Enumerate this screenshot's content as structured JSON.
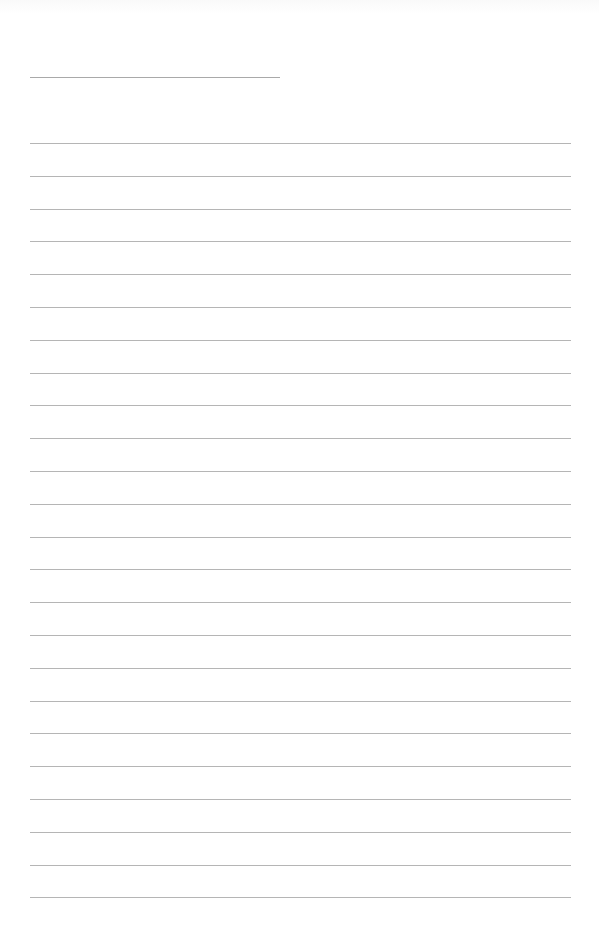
{
  "page": {
    "type": "lined-paper",
    "background": "#ffffff",
    "line_color": "#b5b5b5"
  },
  "heading_field": {
    "value": "",
    "line": {
      "x": 30,
      "y": 77,
      "width": 250
    }
  },
  "ruled_lines": {
    "count": 24,
    "start_y": 143,
    "spacing": 32.8,
    "x": 30,
    "width": 541,
    "entries": [
      "",
      "",
      "",
      "",
      "",
      "",
      "",
      "",
      "",
      "",
      "",
      "",
      "",
      "",
      "",
      "",
      "",
      "",
      "",
      "",
      "",
      "",
      "",
      ""
    ]
  }
}
